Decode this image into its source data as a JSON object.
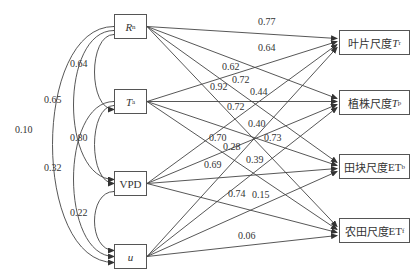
{
  "nodes": {
    "left": [
      {
        "id": "Rn",
        "main": "R",
        "sub": "n",
        "italic": true
      },
      {
        "id": "Ta",
        "main": "T",
        "sub": "a",
        "italic": true
      },
      {
        "id": "VPD",
        "main": "VPD",
        "sub": "",
        "italic": false
      },
      {
        "id": "u",
        "main": "u",
        "sub": "",
        "italic": true
      }
    ],
    "right": [
      {
        "id": "Tr",
        "prefix": "叶片尺度",
        "main": "T",
        "sub": "r",
        "italic": true
      },
      {
        "id": "Tp",
        "prefix": "植株尺度",
        "main": "T",
        "sub": "p",
        "italic": true
      },
      {
        "id": "ETb",
        "prefix": "田块尺度",
        "main": "ET",
        "sub": "b",
        "italic": false
      },
      {
        "id": "ETf",
        "prefix": "农田尺度",
        "main": "ET",
        "sub": "f",
        "italic": false
      }
    ]
  },
  "correlations": [
    {
      "from": "Rn",
      "to": "Ta",
      "value": "0.64"
    },
    {
      "from": "Rn",
      "to": "VPD",
      "value": "0.65"
    },
    {
      "from": "Rn",
      "to": "u",
      "value": "0.10"
    },
    {
      "from": "Ta",
      "to": "VPD",
      "value": "0.80"
    },
    {
      "from": "Ta",
      "to": "u",
      "value": "0.32"
    },
    {
      "from": "VPD",
      "to": "u",
      "value": "0.22"
    }
  ],
  "paths": [
    {
      "from": "Rn",
      "to": "Tr",
      "value": "0.77"
    },
    {
      "from": "Rn",
      "to": "Tp",
      "value": "0.64"
    },
    {
      "from": "Rn",
      "to": "ETb",
      "value": "0.62"
    },
    {
      "from": "Rn",
      "to": "ETf",
      "value": "0.92"
    },
    {
      "from": "Ta",
      "to": "Tr",
      "value": "0.72"
    },
    {
      "from": "Ta",
      "to": "Tp",
      "value": "0.44"
    },
    {
      "from": "Ta",
      "to": "ETb",
      "value": "0.72"
    },
    {
      "from": "Ta",
      "to": "ETf",
      "value": "0.40"
    },
    {
      "from": "VPD",
      "to": "Tr",
      "value": "0.70"
    },
    {
      "from": "VPD",
      "to": "Tp",
      "value": "0.28"
    },
    {
      "from": "VPD",
      "to": "ETb",
      "value": "0.69"
    },
    {
      "from": "VPD",
      "to": "ETf",
      "value": "0.74"
    },
    {
      "from": "u",
      "to": "Tr",
      "value": "0.73"
    },
    {
      "from": "u",
      "to": "Tp",
      "value": "0.39"
    },
    {
      "from": "u",
      "to": "ETb",
      "value": "0.15"
    },
    {
      "from": "u",
      "to": "ETf",
      "value": "0.06"
    }
  ]
}
